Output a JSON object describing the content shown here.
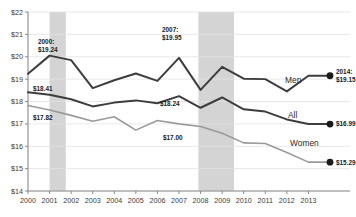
{
  "chart_data": {
    "type": "line",
    "title": "",
    "xlabel": "",
    "ylabel": "",
    "ylim": [
      14,
      22
    ],
    "grid": true,
    "legend_position": "inline-right",
    "categories": [
      2000,
      2001,
      2002,
      2003,
      2004,
      2005,
      2006,
      2007,
      2008,
      2009,
      2010,
      2011,
      2012,
      2013,
      2014
    ],
    "x": [
      "2000",
      "2001",
      "2002",
      "2003",
      "2004",
      "2005",
      "2006",
      "2007",
      "2008",
      "2009",
      "2010",
      "2011",
      "2012",
      "2013"
    ],
    "ytick_labels": [
      "$22",
      "$21",
      "$20",
      "$19",
      "$18",
      "$17",
      "$16",
      "$15",
      "$14"
    ],
    "ytick_values": [
      22,
      21,
      20,
      19,
      18,
      17,
      16,
      15,
      14
    ],
    "series": [
      {
        "name": "Men",
        "color": "#3d3d3d",
        "values": [
          19.24,
          20.05,
          19.85,
          18.6,
          18.95,
          19.25,
          18.92,
          19.95,
          18.52,
          19.55,
          19.02,
          19.0,
          18.45,
          19.15,
          19.15
        ]
      },
      {
        "name": "All",
        "color": "#3d3d3d",
        "values": [
          18.41,
          18.3,
          18.1,
          17.78,
          17.95,
          18.05,
          17.92,
          18.24,
          17.72,
          18.18,
          17.65,
          17.55,
          17.2,
          16.99,
          16.99
        ]
      },
      {
        "name": "Women",
        "color": "#9a9a9a",
        "values": [
          17.82,
          17.62,
          17.38,
          17.12,
          17.32,
          16.72,
          17.15,
          17.0,
          16.88,
          16.58,
          16.15,
          16.12,
          15.72,
          15.29,
          15.29
        ]
      }
    ],
    "annotations": [
      {
        "id": "men-2000",
        "text_line1": "2000:",
        "text_line2": "$19.24",
        "x": 38,
        "y": 44,
        "series": "Men"
      },
      {
        "id": "men-2007",
        "text_line1": "2007:",
        "text_line2": "$19.95",
        "x": 162,
        "y": 32,
        "series": "Men"
      },
      {
        "id": "all-2000",
        "text": "$18.41",
        "x": 33,
        "y": 91,
        "series": "All"
      },
      {
        "id": "all-2007",
        "text": "$18.24",
        "x": 160,
        "y": 106,
        "series": "All"
      },
      {
        "id": "women-2000",
        "text": "$17.82",
        "x": 33,
        "y": 120,
        "series": "Women"
      },
      {
        "id": "women-2007",
        "text": "$17.00",
        "x": 163,
        "y": 140,
        "series": "Women"
      }
    ],
    "endpoints": [
      {
        "id": "men-end",
        "label_line1": "2014:",
        "label_line2": "$19.15",
        "series": "Men",
        "marker_color": "#1a1a1a"
      },
      {
        "id": "all-end",
        "label": "$16.99",
        "series": "All",
        "marker_color": "#1a1a1a"
      },
      {
        "id": "women-end",
        "label": "$15.29",
        "series": "Women",
        "marker_color": "#1a1a1a"
      }
    ],
    "series_labels": [
      {
        "name": "Men",
        "x": 285,
        "y": 83
      },
      {
        "name": "All",
        "x": 288,
        "y": 118
      },
      {
        "name": "Women",
        "x": 290,
        "y": 146
      }
    ],
    "shaded_bands": [
      {
        "id": "recession-2001",
        "from": "2001",
        "to": "2001.75",
        "color": "#d4d4d4"
      },
      {
        "id": "recession-2008",
        "from": "2007.9",
        "to": "2009.55",
        "color": "#d4d4d4"
      }
    ],
    "colors": {
      "men": "#3d3d3d",
      "all": "#3d3d3d",
      "women": "#9a9a9a",
      "grid": "#e2e2e2",
      "axis": "#8a8a8a",
      "band": "#d4d4d4",
      "text": "#2a2a2a"
    }
  }
}
